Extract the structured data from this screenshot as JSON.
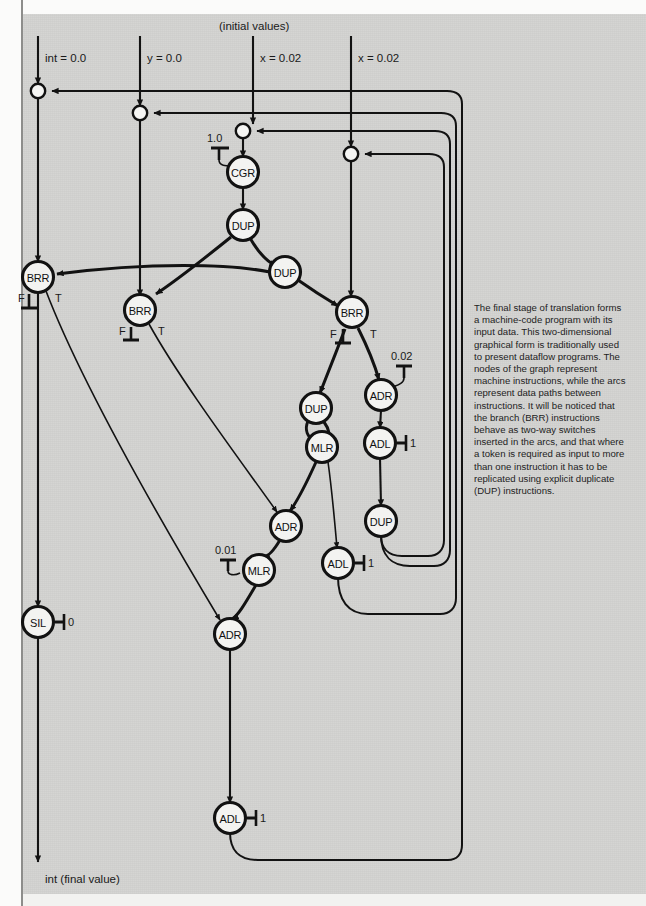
{
  "figure": {
    "background_color": "#d3d3d1",
    "ink_color": "#121212",
    "top_label": "(initial values)",
    "bottom_label": "int (final value)"
  },
  "inputs": [
    {
      "id": "in-int",
      "label": "int = 0.0",
      "x": 38
    },
    {
      "id": "in-y",
      "label": "y = 0.0",
      "x": 140
    },
    {
      "id": "in-x1",
      "label": "x = 0.02",
      "x": 253
    },
    {
      "id": "in-x2",
      "label": "x = 0.02",
      "x": 351
    }
  ],
  "constants": [
    {
      "id": "k-cgr",
      "value": "1.0",
      "attached_to": "CGR merge"
    },
    {
      "id": "k-adr1",
      "value": "0.02",
      "attached_to": "ADR (right)"
    },
    {
      "id": "k-adl1",
      "value": "1",
      "attached_to": "ADL (upper right)"
    },
    {
      "id": "k-mlr2",
      "value": "0.01",
      "attached_to": "MLR (lower)"
    },
    {
      "id": "k-adl2",
      "value": "1",
      "attached_to": "ADL (middle)"
    },
    {
      "id": "k-sil",
      "value": "0",
      "attached_to": "SIL"
    },
    {
      "id": "k-adl3",
      "value": "1",
      "attached_to": "ADL (bottom)"
    }
  ],
  "nodes": [
    {
      "id": "n1",
      "label": "CGR",
      "x": 243,
      "y": 172
    },
    {
      "id": "n2",
      "label": "DUP",
      "x": 243,
      "y": 225
    },
    {
      "id": "n3",
      "label": "DUP",
      "x": 285,
      "y": 272
    },
    {
      "id": "n4",
      "label": "BRR",
      "x": 38,
      "y": 277
    },
    {
      "id": "n5",
      "label": "BRR",
      "x": 140,
      "y": 310
    },
    {
      "id": "n6",
      "label": "BRR",
      "x": 352,
      "y": 312
    },
    {
      "id": "n7",
      "label": "DUP",
      "x": 316,
      "y": 408
    },
    {
      "id": "n8",
      "label": "ADR",
      "x": 381,
      "y": 395
    },
    {
      "id": "n9",
      "label": "MLR",
      "x": 322,
      "y": 447
    },
    {
      "id": "n10",
      "label": "ADL",
      "x": 380,
      "y": 443
    },
    {
      "id": "n11",
      "label": "ADR",
      "x": 286,
      "y": 526
    },
    {
      "id": "n12",
      "label": "DUP",
      "x": 381,
      "y": 521
    },
    {
      "id": "n13",
      "label": "MLR",
      "x": 259,
      "y": 570
    },
    {
      "id": "n14",
      "label": "ADL",
      "x": 338,
      "y": 563
    },
    {
      "id": "n15",
      "label": "ADR",
      "x": 230,
      "y": 634
    },
    {
      "id": "n16",
      "label": "SIL",
      "x": 38,
      "y": 622
    },
    {
      "id": "n17",
      "label": "ADL",
      "x": 230,
      "y": 818
    }
  ],
  "branch_labels": [
    {
      "node": "n4",
      "false": "F",
      "true": "T"
    },
    {
      "node": "n5",
      "false": "F",
      "true": "T"
    },
    {
      "node": "n6",
      "false": "F",
      "true": "T"
    }
  ],
  "merge_points": [
    {
      "id": "m-int",
      "x": 38,
      "y": 91
    },
    {
      "id": "m-y",
      "x": 140,
      "y": 113
    },
    {
      "id": "m-x1",
      "x": 243,
      "y": 131
    },
    {
      "id": "m-x2",
      "x": 351,
      "y": 154
    }
  ],
  "feedback_rails": [
    {
      "id": "rail-1",
      "x": 462,
      "from": "n17 (ADL bottom)",
      "to": "m-int"
    },
    {
      "id": "rail-2",
      "x": 456,
      "from": "n14 (ADL middle)",
      "to": "m-y"
    },
    {
      "id": "rail-3",
      "x": 450,
      "from": "n12 (DUP)",
      "to": "m-x1"
    },
    {
      "id": "rail-4",
      "x": 444,
      "from": "n12 (DUP)",
      "to": "m-x2"
    }
  ],
  "caption": {
    "text": "The final stage of translation forms a machine-code program with its input data. This two-dimensional graphical form is traditionally used to present dataflow programs. The nodes of the graph represent machine instructions, while the arcs represent data paths between instructions. It will be noticed that the branch (BRR) instructions behave as two-way switches inserted in the arcs, and that where a token is required as input to more than one instruction it has to be replicated using explicit duplicate (DUP) instructions."
  }
}
